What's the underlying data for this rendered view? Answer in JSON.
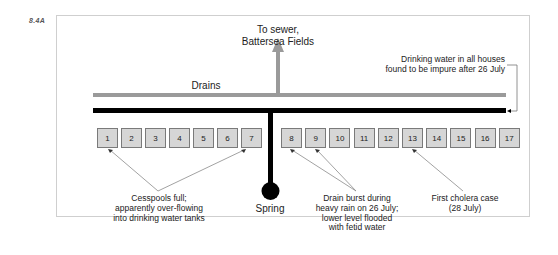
{
  "figure_label": "8.4A",
  "sewer_label_line1": "To sewer,",
  "sewer_label_line2": "Battersea Fields",
  "drains_label": "Drains",
  "impure_note_line1": "Drinking water in all houses",
  "impure_note_line2": "found to be impure after 26 July",
  "spring_label": "Spring",
  "houses": [
    "1",
    "2",
    "3",
    "4",
    "5",
    "6",
    "7",
    "8",
    "9",
    "10",
    "11",
    "12",
    "13",
    "14",
    "15",
    "16",
    "17"
  ],
  "annotations": {
    "cesspools": [
      "Cesspools full;",
      "apparently over-flowing",
      "into drinking water tanks"
    ],
    "drain_burst": [
      "Drain burst during",
      "heavy rain on 26 July;",
      "lower level flooded",
      "with fetid water"
    ],
    "cholera": [
      "First cholera case",
      "(28 July)"
    ]
  },
  "colors": {
    "drain_gray": "#9a9a9a",
    "pipe_black": "#000000",
    "house_fill": "#d6d6d6",
    "house_border": "#7a7a7a",
    "leader_line": "#8a8a8a"
  }
}
